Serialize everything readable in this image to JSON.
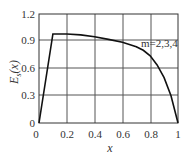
{
  "chart_data": {
    "type": "line",
    "title": "",
    "xlabel": "x",
    "ylabel": "E_s(x)",
    "xlim": [
      0,
      1
    ],
    "ylim": [
      0,
      1.2
    ],
    "xticks": [
      "0",
      "0.2",
      "0.4",
      "0.6",
      "0.8",
      "1"
    ],
    "yticks": [
      "0",
      "0.3",
      "0.6",
      "0.9",
      "1.2"
    ],
    "grid": true,
    "legend": null,
    "annotations": [
      {
        "text": "m=2,3,4",
        "x": 0.8,
        "y": 0.86
      }
    ],
    "series": [
      {
        "name": "m=2,3,4",
        "x": [
          0,
          0.1,
          0.2,
          0.3,
          0.4,
          0.5,
          0.6,
          0.7,
          0.75,
          0.8,
          0.85,
          0.9,
          0.95,
          1.0
        ],
        "y": [
          0,
          0.98,
          0.98,
          0.97,
          0.95,
          0.92,
          0.89,
          0.84,
          0.8,
          0.74,
          0.64,
          0.5,
          0.3,
          0
        ]
      }
    ]
  },
  "labels": {
    "x_axis": "x",
    "y_axis_main": "E",
    "y_axis_sub": "s",
    "y_axis_arg": "(x)",
    "annotation": "m=2,3,4"
  },
  "ticks": {
    "x": [
      "0",
      "0.2",
      "0.4",
      "0.6",
      "0.8",
      "1"
    ],
    "y": [
      "0",
      "0.3",
      "0.6",
      "0.9",
      "1.2"
    ]
  },
  "colors": {
    "line": "#111111",
    "grid": "#555555",
    "text": "#333333"
  }
}
